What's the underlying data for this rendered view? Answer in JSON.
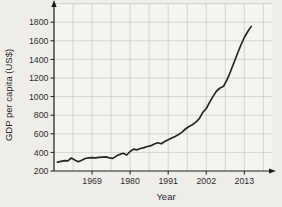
{
  "chart_data": {
    "type": "line",
    "title": "",
    "xlabel": "Year",
    "ylabel": "GDP per capita (US$)",
    "legend": "none",
    "grid": "on",
    "xlim": [
      1958,
      2021
    ],
    "ylim": [
      200,
      2000
    ],
    "x_ticks": [
      1969,
      1980,
      1991,
      2002,
      2013
    ],
    "y_ticks": [
      200,
      400,
      600,
      800,
      1000,
      1200,
      1400,
      1600,
      1800
    ],
    "line_color": "#262626",
    "grid_color": "#cbcac7",
    "axis_color": "#1c1c1c",
    "plot_bg_color": "#f5f4f1",
    "page_bg_color": "#efedea",
    "series": [
      {
        "name": "GDP per capita",
        "years": [
          1959,
          1960,
          1961,
          1962,
          1963,
          1964,
          1965,
          1966,
          1967,
          1968,
          1969,
          1970,
          1971,
          1972,
          1973,
          1974,
          1975,
          1976,
          1977,
          1978,
          1979,
          1980,
          1981,
          1982,
          1983,
          1984,
          1985,
          1986,
          1987,
          1988,
          1989,
          1990,
          1991,
          1992,
          1993,
          1994,
          1995,
          1996,
          1997,
          1998,
          1999,
          2000,
          2001,
          2002,
          2003,
          2004,
          2005,
          2006,
          2007,
          2008,
          2009,
          2010,
          2011,
          2012,
          2013,
          2014,
          2015
        ],
        "values": [
          295,
          303,
          312,
          310,
          340,
          318,
          300,
          316,
          334,
          341,
          344,
          342,
          346,
          350,
          352,
          341,
          336,
          360,
          378,
          390,
          372,
          410,
          435,
          428,
          442,
          452,
          463,
          472,
          490,
          503,
          493,
          517,
          537,
          555,
          572,
          591,
          618,
          652,
          678,
          698,
          726,
          762,
          830,
          872,
          940,
          1005,
          1060,
          1092,
          1112,
          1180,
          1270,
          1365,
          1460,
          1555,
          1635,
          1700,
          1755
        ]
      }
    ]
  }
}
